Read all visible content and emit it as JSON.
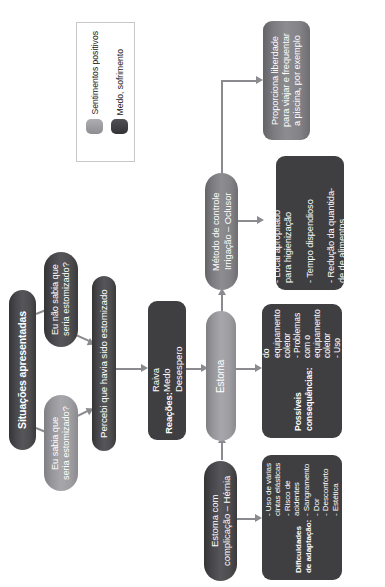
{
  "diagram": {
    "legend": {
      "items": [
        {
          "label": "Sentimentos positivos",
          "color": "#9b9ba0"
        },
        {
          "label": "Medo, sofrimento",
          "color": "#444447"
        }
      ]
    },
    "nodes": {
      "situacoes": {
        "label": "Situações apresentadas"
      },
      "nao_sabia": {
        "label": "Eu não sabia que\nseria estomizado?"
      },
      "sabia": {
        "label": "Eu sabia que\nseria estomizado?"
      },
      "percebi": {
        "label": "Percebi que havia sido estomizado"
      },
      "reacoes_title": {
        "label": "Reações:"
      },
      "reacoes_items": {
        "label": "Raiva\nMedo\nDesespero"
      },
      "estoma": {
        "label": "Estoma"
      },
      "estoma_compl": {
        "label": "Estoma com\ncomplicação – Hérnia"
      },
      "metodo": {
        "label": "Método de controle\nIrrigação – Oclusor"
      },
      "liberdade": {
        "label": "Proporciona liberdade\npara viajar e frequentar\na piscina, por exemplo"
      },
      "irrigacao_contras": {
        "label": "- Local apropriado\npara higienização\n\n- Tempo dispendioso\n\n- Redução da quantida-\nde de alimentos"
      },
      "consequencias": {
        "title": "Possíveis consequências:",
        "items": "- Lesão de pele\n- Descolamento do\nequipamento coletor\n- Problemas com o\nequipamento coletor\n- Uso inadequado do\nequipamento coletor"
      },
      "dificuldades": {
        "title": "Dificuldades de adaptação:",
        "items": "- Uso de várias cintas elásticas\n- Risco de acidentes\n-  Sangramento\n-  Dor\n-  Desconforto\n-  Estética"
      }
    },
    "colors": {
      "edge": "#8b8b8f",
      "dark": "#46464a",
      "mid": "#7f7f84",
      "light": "#9b9ba0",
      "text_on_node": "#ffffff",
      "legend_border": "#c8c8c8",
      "background": "#ffffff"
    }
  }
}
